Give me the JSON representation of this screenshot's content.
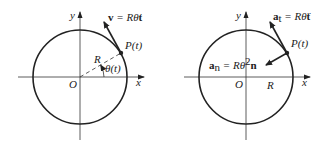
{
  "figure": {
    "left": {
      "title": "velocity diagram",
      "axis_x": "x",
      "axis_y": "y",
      "origin": "O",
      "point": "P(t)",
      "radius_label": "R",
      "angle_label": "θ(t)",
      "vector_label_bold": "v",
      "vector_label_eq": " = Rθ̇",
      "vector_label_unit": "t"
    },
    "right": {
      "title": "acceleration diagram",
      "axis_x": "x",
      "axis_y": "y",
      "origin": "O",
      "point": "P(t)",
      "radius_label": "R",
      "tangential_bold": "a",
      "tangential_sub": "t",
      "tangential_eq": " = Rθ̈",
      "tangential_unit": "t",
      "normal_bold": "a",
      "normal_sub": "n",
      "normal_eq": " = Rθ̇",
      "normal_sup": "2",
      "normal_unit": "n"
    },
    "colors": {
      "stroke": "#222222",
      "background": "#ffffff"
    }
  }
}
